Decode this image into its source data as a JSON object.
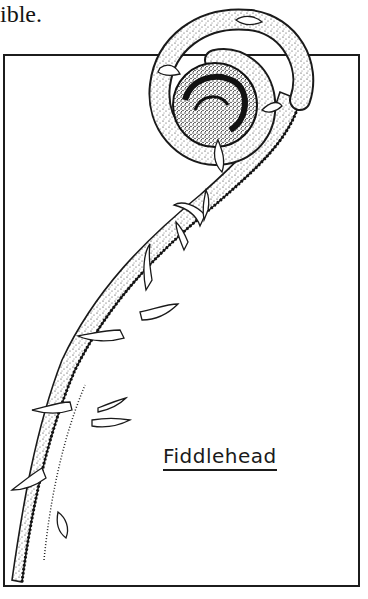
{
  "page": {
    "top_text": "ible."
  },
  "figure": {
    "caption": "Fiddlehead",
    "illustration": "fern-fiddlehead-drawing",
    "colors": {
      "ink": "#1a1a1a",
      "paper": "#ffffff"
    }
  }
}
